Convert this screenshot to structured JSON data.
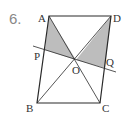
{
  "problem": {
    "number": "6."
  },
  "colors": {
    "stroke": "#2a2a2a",
    "shade": "#bdbdbd",
    "text": "#333333",
    "number": "#888888"
  },
  "points": {
    "A": {
      "label": "A",
      "x": 49,
      "y": 16
    },
    "D": {
      "label": "D",
      "x": 111,
      "y": 16
    },
    "B": {
      "label": "B",
      "x": 37,
      "y": 103
    },
    "C": {
      "label": "C",
      "x": 100,
      "y": 103
    },
    "O": {
      "label": "O",
      "x": 76,
      "y": 60
    },
    "P": {
      "label": "P",
      "x": 45,
      "y": 50
    },
    "Q": {
      "label": "Q",
      "x": 105,
      "y": 68
    }
  },
  "shaded_regions": [
    {
      "name": "triangle-APO",
      "vertices": [
        "A",
        "P",
        "O"
      ]
    },
    {
      "name": "triangle-DOQ",
      "vertices": [
        "D",
        "O",
        "Q"
      ]
    }
  ],
  "segments": [
    [
      "A",
      "D"
    ],
    [
      "D",
      "C"
    ],
    [
      "C",
      "B"
    ],
    [
      "B",
      "A"
    ],
    [
      "A",
      "C"
    ],
    [
      "B",
      "D"
    ]
  ],
  "line_PQ": {
    "through": [
      "P",
      "Q"
    ],
    "extended": true
  }
}
